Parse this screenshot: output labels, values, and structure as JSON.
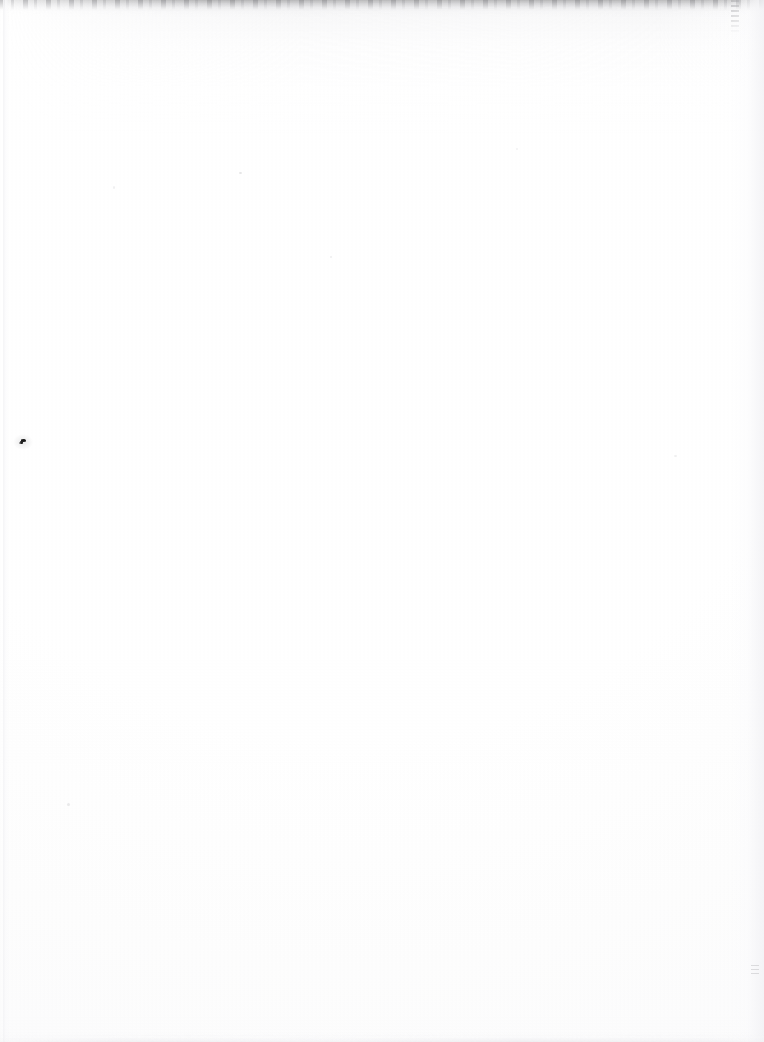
{
  "document": {
    "kind": "scanned-page",
    "content_description": "blank page",
    "text_content": "",
    "orientation": "portrait",
    "page_width_px": 764,
    "page_height_px": 1042,
    "paper_color": "#ffffff",
    "paper_tint": "#fdfdfd"
  },
  "artifacts": {
    "top_smudge": {
      "name": "top edge smudge band",
      "color": "#a8a8a8",
      "height_px": 8,
      "x_start_px": 10,
      "x_end_px": 756
    },
    "right_streak": {
      "name": "vertical dash streak",
      "color": "#9e9ea2",
      "x_px": 735,
      "y_start_px": 0,
      "y_end_px": 32
    },
    "left_edge": {
      "name": "page edge line",
      "color": "#f4f4f6",
      "x_px": 5
    },
    "right_edge": {
      "name": "page edge shadow",
      "color": "#f2f2f5"
    },
    "bottom_edge": {
      "name": "bottom edge band",
      "color": "#eaeaed"
    },
    "ink_speck": {
      "name": "ink speck",
      "color": "#191919",
      "x_px": 22,
      "y_px": 442,
      "width_px": 7,
      "height_px": 6
    },
    "faint_speck": {
      "name": "faint gray speck",
      "color": "#acacb0",
      "x_px": 755,
      "y_px": 970
    }
  }
}
